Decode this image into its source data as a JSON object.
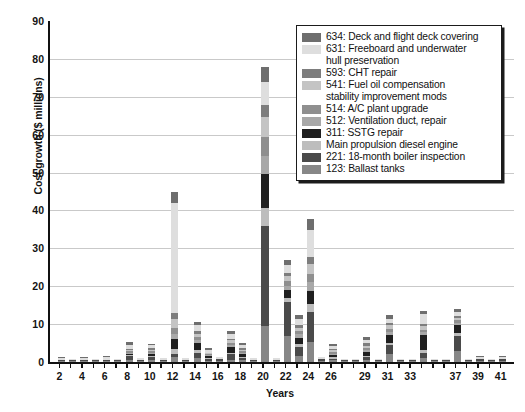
{
  "chart_data": {
    "type": "bar",
    "stacked": true,
    "title": "",
    "xlabel": "Years",
    "ylabel": "Cost growth ($ millions)",
    "ylim": [
      0,
      90
    ],
    "ytick_step": 10,
    "yticks": [
      90,
      80,
      70,
      60,
      50,
      40,
      30,
      20,
      10,
      0
    ],
    "grid": "horizontal",
    "xlim": [
      1,
      42
    ],
    "xticks": [
      2,
      4,
      6,
      8,
      10,
      12,
      14,
      16,
      18,
      20,
      22,
      24,
      26,
      29,
      31,
      33,
      37,
      39,
      41
    ],
    "x": [
      2,
      3,
      4,
      5,
      6,
      7,
      8,
      9,
      10,
      11,
      12,
      13,
      14,
      15,
      16,
      17,
      18,
      19,
      20,
      21,
      22,
      23,
      24,
      25,
      26,
      27,
      28,
      29,
      30,
      31,
      32,
      33,
      34,
      35,
      36,
      37,
      38,
      39,
      40,
      41
    ],
    "series": [
      {
        "name": "634: Deck and flight deck covering",
        "color": "#6e6e6e",
        "values": [
          0.4,
          0,
          0.3,
          0,
          0.3,
          0,
          0.9,
          0,
          0.5,
          0,
          3.1,
          0,
          0.9,
          0.4,
          0,
          0.7,
          0.4,
          0,
          4.1,
          0,
          1.3,
          1.1,
          3.0,
          0,
          0.6,
          0,
          0,
          0.8,
          0,
          1.0,
          0,
          0,
          1.0,
          0,
          0,
          0.8,
          0,
          0.3,
          0,
          0.4
        ]
      },
      {
        "name": "631: Freeboard and underwater hull preservation",
        "color": "#dedede",
        "values": [
          0.5,
          0.3,
          0.5,
          0.3,
          0.6,
          0.4,
          1.1,
          0.5,
          0.8,
          0.6,
          29.0,
          0.6,
          1.6,
          0.9,
          0.7,
          1.3,
          0.9,
          0.5,
          6.0,
          0.5,
          2.0,
          1.6,
          7.0,
          0.5,
          0.7,
          0.3,
          0.3,
          1.0,
          0.4,
          1.1,
          0.4,
          0.3,
          2.5,
          0.3,
          0.3,
          1.0,
          0.3,
          0.5,
          0.3,
          0.6
        ]
      },
      {
        "name": "593: CHT repair",
        "color": "#7d7d7d",
        "values": [
          0,
          0,
          0,
          0,
          0,
          0,
          0.3,
          0,
          0.4,
          0,
          1.6,
          0,
          0.6,
          0,
          0,
          0.5,
          0.4,
          0,
          3.2,
          0,
          0.9,
          0.7,
          1.9,
          0,
          0.4,
          0,
          0,
          0.6,
          0,
          0.7,
          0,
          0,
          0.6,
          0,
          0,
          0.5,
          0,
          0,
          0,
          0
        ]
      },
      {
        "name": "541: Fuel oil compensation stability improvement mods",
        "color": "#c4c4c4",
        "values": [
          0,
          0,
          0,
          0,
          0,
          0,
          0.3,
          0,
          0.4,
          0,
          2.4,
          0,
          1.0,
          0.3,
          0,
          0.6,
          0.5,
          0,
          5.3,
          0,
          1.4,
          1.0,
          2.6,
          0,
          0.5,
          0,
          0,
          0.7,
          0,
          0.9,
          0,
          0,
          0.9,
          0,
          0,
          0.7,
          0,
          0,
          0,
          0
        ]
      },
      {
        "name": "514: A/C plant upgrade",
        "color": "#8f8f8f",
        "values": [
          0,
          0,
          0,
          0,
          0,
          0,
          0.3,
          0,
          0.3,
          0,
          1.5,
          0,
          0.8,
          0.3,
          0,
          0.5,
          0.4,
          0,
          4.9,
          0,
          1.1,
          0.8,
          2.1,
          0,
          0.4,
          0,
          0,
          0.5,
          0,
          0.8,
          0,
          0,
          0.7,
          0,
          0,
          0.6,
          0,
          0,
          0,
          0
        ]
      },
      {
        "name": "512: Ventilation duct, repair",
        "color": "#a8a8a8",
        "values": [
          0,
          0,
          0,
          0,
          0,
          0,
          0.3,
          0,
          0.3,
          0,
          1.4,
          0,
          0.8,
          0.3,
          0,
          0.5,
          0.4,
          0,
          5.0,
          0,
          1.1,
          0.9,
          2.4,
          0,
          0.4,
          0,
          0,
          0.5,
          0,
          0.8,
          0,
          0,
          0.8,
          0,
          0,
          0.6,
          0,
          0,
          0,
          0
        ]
      },
      {
        "name": "311: SSTG repair",
        "color": "#1f1f1f",
        "values": [
          0,
          0,
          0,
          0,
          0,
          0,
          0.4,
          0,
          0.5,
          0,
          2.6,
          0,
          1.8,
          0.5,
          0,
          1.6,
          0.6,
          0,
          8.9,
          0,
          2.2,
          1.7,
          3.6,
          0,
          0.5,
          0,
          0,
          0.9,
          0,
          2.1,
          0,
          0,
          4.0,
          0,
          0,
          2.2,
          0,
          0,
          0,
          0
        ]
      },
      {
        "name": "Main propulsion diesel engine",
        "color": "#bdbdbd",
        "values": [
          0,
          0,
          0,
          0,
          0,
          0,
          0.3,
          0,
          0.3,
          0,
          1.2,
          0,
          0.7,
          0.3,
          0,
          0.5,
          0.4,
          0,
          4.8,
          0,
          1.0,
          0.8,
          2.0,
          0,
          0.4,
          0,
          0,
          0.5,
          0,
          0.7,
          0,
          0,
          0.8,
          0,
          0,
          0.6,
          0,
          0,
          0,
          0
        ]
      },
      {
        "name": "221: 18-month boiler inspection",
        "color": "#4a4a4a",
        "values": [
          0.2,
          0.2,
          0.2,
          0.2,
          0.2,
          0.2,
          0.9,
          0.2,
          0.9,
          0.2,
          1.0,
          0.2,
          1.4,
          0.3,
          0.3,
          1.4,
          0.5,
          0.2,
          26.4,
          0.2,
          9.0,
          2.3,
          8.0,
          0.3,
          0.4,
          0.2,
          0.2,
          0.6,
          0.2,
          2.2,
          0.2,
          0.2,
          1.2,
          0.2,
          0.2,
          4.2,
          0.2,
          0.3,
          0.2,
          0.3
        ]
      },
      {
        "name": "123: Ballast tanks",
        "color": "#878787",
        "values": [
          0.3,
          0.3,
          0.3,
          0.3,
          0.4,
          0.3,
          0.6,
          0.3,
          0.5,
          0.3,
          1.2,
          0.3,
          1.0,
          0.4,
          0.4,
          0.6,
          0.5,
          0.3,
          9.4,
          0.3,
          6.9,
          1.6,
          5.2,
          0.4,
          0.5,
          0.3,
          0.3,
          0.6,
          0.3,
          2.2,
          0.3,
          0.3,
          1.1,
          0.3,
          0.3,
          2.8,
          0.3,
          0.4,
          0.3,
          0.4
        ]
      }
    ],
    "totals": [
      1.4,
      0.8,
      1.3,
      0.8,
      1.5,
      0.9,
      5.4,
      1.0,
      4.9,
      1.1,
      45.0,
      1.1,
      10.6,
      3.7,
      1.4,
      8.2,
      5.0,
      1.0,
      78.0,
      1.0,
      26.9,
      12.5,
      37.8,
      1.2,
      4.3,
      0.8,
      0.8,
      6.7,
      0.9,
      11.5,
      0.9,
      0.8,
      13.6,
      0.8,
      0.8,
      14.0,
      0.8,
      1.5,
      0.8,
      1.7
    ]
  },
  "legend": {
    "entries": [
      {
        "label": "634: Deck and flight deck covering",
        "cont": "",
        "color": "#6e6e6e"
      },
      {
        "label": "631: Freeboard and underwater",
        "cont": "hull preservation",
        "color": "#dedede"
      },
      {
        "label": "593: CHT repair",
        "cont": "",
        "color": "#7d7d7d"
      },
      {
        "label": "541: Fuel oil compensation",
        "cont": "stability improvement mods",
        "color": "#c4c4c4"
      },
      {
        "label": "514: A/C plant upgrade",
        "cont": "",
        "color": "#8f8f8f"
      },
      {
        "label": "512: Ventilation duct, repair",
        "cont": "",
        "color": "#a8a8a8"
      },
      {
        "label": "311: SSTG repair",
        "cont": "",
        "color": "#1f1f1f"
      },
      {
        "label": "Main propulsion diesel engine",
        "cont": "",
        "color": "#bdbdbd"
      },
      {
        "label": "221: 18-month boiler inspection",
        "cont": "",
        "color": "#4a4a4a"
      },
      {
        "label": "123: Ballast tanks",
        "cont": "",
        "color": "#878787"
      }
    ]
  },
  "axes": {
    "y_title": "Cost growth ($ millions)",
    "x_title": "Years"
  }
}
